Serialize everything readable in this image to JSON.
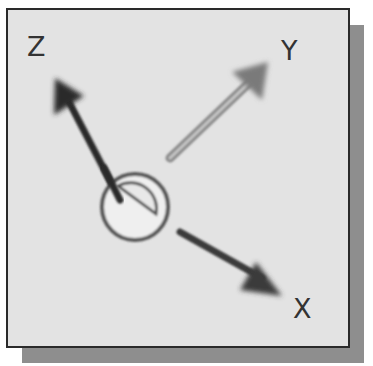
{
  "diagram": {
    "type": "coordinate-triad",
    "axes": [
      {
        "label": "Z",
        "color": "#2b2b2b"
      },
      {
        "label": "Y",
        "color": "#8a8a8a"
      },
      {
        "label": "X",
        "color": "#3a3a3a"
      }
    ],
    "origin_symbol": "work-coordinate-origin",
    "colors": {
      "panel": "#e3e3e3",
      "border": "#2a2a2a",
      "shadow": "#8e8e8e"
    }
  }
}
